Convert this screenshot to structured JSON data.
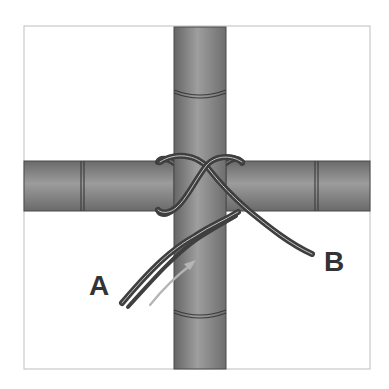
{
  "diagram": {
    "labels": {
      "a": "A",
      "b": "B"
    },
    "elements": {
      "vertical_pole": "bamboo-pole-vertical",
      "horizontal_pole": "bamboo-pole-horizontal",
      "cord": "double-strand-cord",
      "arrow": "direction-arrow"
    },
    "colors": {
      "frame": "#c8c8c8",
      "pole_edge": "#6a6a6a",
      "pole_center": "#9c9c9c",
      "pole_outline": "#4a4a4a",
      "cord": "#3f3f3f",
      "cord_highlight": "#bdbdbd",
      "arrow": "#b5b5b5",
      "label": "#333333",
      "background": "#ffffff"
    }
  }
}
